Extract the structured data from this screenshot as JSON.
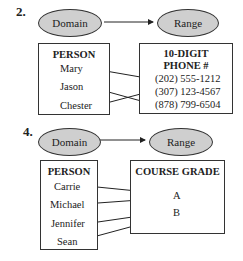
{
  "problem2": {
    "number": "2.",
    "domain_label": "Domain",
    "range_label": "Range",
    "domain_header": "PERSON",
    "range_header_line1": "10-DIGIT",
    "range_header_line2": "PHONE #",
    "domain_items": [
      "Mary",
      "Jason",
      "Chester"
    ],
    "range_items": [
      "(202) 555-1212",
      "(307) 123-4567",
      "(878) 799-6504"
    ],
    "mappings": [
      {
        "from": "Mary",
        "to": "(202) 555-1212"
      },
      {
        "from": "Jason",
        "to": "(878) 799-6504"
      },
      {
        "from": "Chester",
        "to": "(307) 123-4567"
      }
    ]
  },
  "problem4": {
    "number": "4.",
    "domain_label": "Domain",
    "range_label": "Range",
    "domain_header": "PERSON",
    "range_header": "COURSE GRADE",
    "domain_items": [
      "Carrie",
      "Michael",
      "Jennifer",
      "Sean"
    ],
    "range_items": [
      "A",
      "B"
    ],
    "mappings": [
      {
        "from": "Carrie",
        "to": "A"
      },
      {
        "from": "Michael",
        "to": "A"
      },
      {
        "from": "Jennifer",
        "to": "B"
      },
      {
        "from": "Sean",
        "to": "B"
      }
    ]
  },
  "colors": {
    "ellipse_fill": "#cfcfcf",
    "stroke": "#333333"
  }
}
